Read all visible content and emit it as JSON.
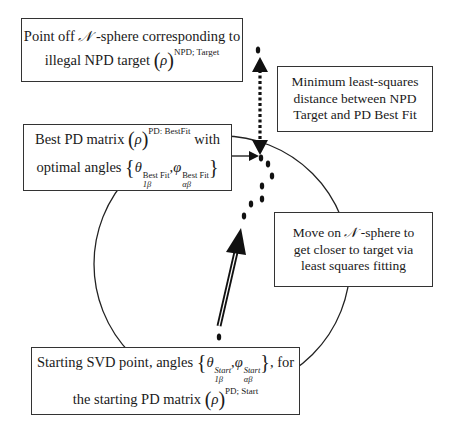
{
  "diagram": {
    "type": "flow-annotation",
    "sphere_label": "N-sphere",
    "boxes": {
      "target": {
        "line1_prefix": "Point off ",
        "line1_symbol": "𝒩",
        "line1_suffix": " -sphere corresponding to",
        "line2_prefix": "illegal NPD target ",
        "rho": "ρ",
        "superscript": "NPD; Target"
      },
      "best_fit": {
        "line1_prefix": "Best PD matrix ",
        "rho": "ρ",
        "superscript": "PD: BestFit",
        "line1_suffix": " with",
        "line2_prefix": "optimal angles ",
        "theta": "θ",
        "theta_sup": "Best Fit",
        "theta_sub": "1β",
        "comma": ",",
        "phi": "φ",
        "phi_sup": "Best Fit",
        "phi_sub": "αβ"
      },
      "minimum": {
        "line1": "Minimum least-squares",
        "line2": "distance between NPD",
        "line3": "Target and PD Best Fit"
      },
      "move": {
        "line1_prefix": "Move on ",
        "line1_symbol": "𝒩",
        "line1_suffix": " -sphere to",
        "line2": "get closer to target via",
        "line3": "least squares fitting"
      },
      "start": {
        "line1_prefix": "Starting SVD point, angles ",
        "theta": "θ",
        "theta_sup": "Start",
        "theta_sub": "1β",
        "comma": ",",
        "phi": "φ",
        "phi_sup": "Start",
        "phi_sub": "αβ",
        "line1_suffix": ", for",
        "line2_prefix": "the starting PD matrix ",
        "rho": "ρ",
        "superscript": "PD; Start"
      }
    },
    "colors": {
      "stroke": "#1a1a1a",
      "box_border": "#333333",
      "background": "#ffffff"
    }
  }
}
